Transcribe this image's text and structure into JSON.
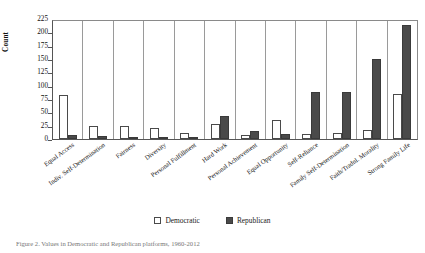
{
  "figure": {
    "caption": "Figure 2. Values in Democratic and Republican platforms, 1960-2012"
  },
  "legend": {
    "position": "bottom-center",
    "items": [
      {
        "label": "Democratic",
        "swatch": "open-square",
        "color": "#ffffff"
      },
      {
        "label": "Republican",
        "swatch": "filled-square",
        "color": "#4a4a4a"
      }
    ]
  },
  "chart_data": {
    "type": "bar",
    "title": "",
    "xlabel": "",
    "ylabel": "Count",
    "ylim": [
      0,
      225
    ],
    "yticks": [
      0,
      25,
      50,
      75,
      100,
      125,
      150,
      175,
      200,
      225
    ],
    "grid": false,
    "categories": [
      "Equal Access",
      "Indiv. Self-Determination",
      "Fairness",
      "Diversity",
      "Personal Fulfillment",
      "Hard Work",
      "Personal Achievement",
      "Equal Opportunity",
      "Self-Reliance",
      "Family Self-Determination",
      "Faith/Tradnl. Morality",
      "Strong Family Life"
    ],
    "series": [
      {
        "name": "Democratic",
        "color": "#ffffff",
        "values": [
          83,
          25,
          24,
          21,
          12,
          28,
          7,
          35,
          10,
          12,
          17,
          85
        ]
      },
      {
        "name": "Republican",
        "color": "#4a4a4a",
        "values": [
          8,
          5,
          3,
          2,
          3,
          43,
          15,
          10,
          88,
          88,
          150,
          213
        ]
      }
    ]
  }
}
